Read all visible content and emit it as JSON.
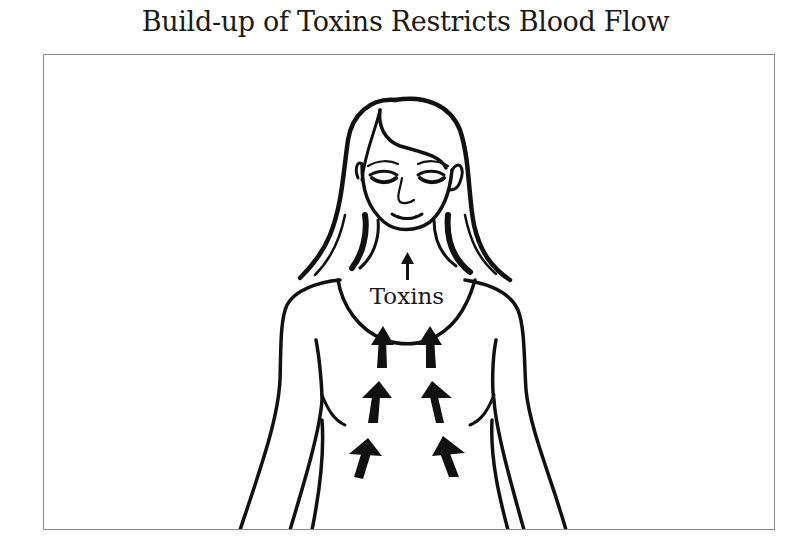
{
  "diagram": {
    "title": "Build-up of Toxins Restricts Blood Flow",
    "label": "Toxins",
    "figure": "woman-upper-body-outline",
    "arrows": {
      "count": 7,
      "direction": "up",
      "description": "Three pairs of thick arrows rising up the torso plus one small arrow in the neck pointing up toward the head"
    },
    "colors": {
      "ink": "#111111",
      "frame": "#8a8a8a",
      "background": "#ffffff"
    }
  }
}
